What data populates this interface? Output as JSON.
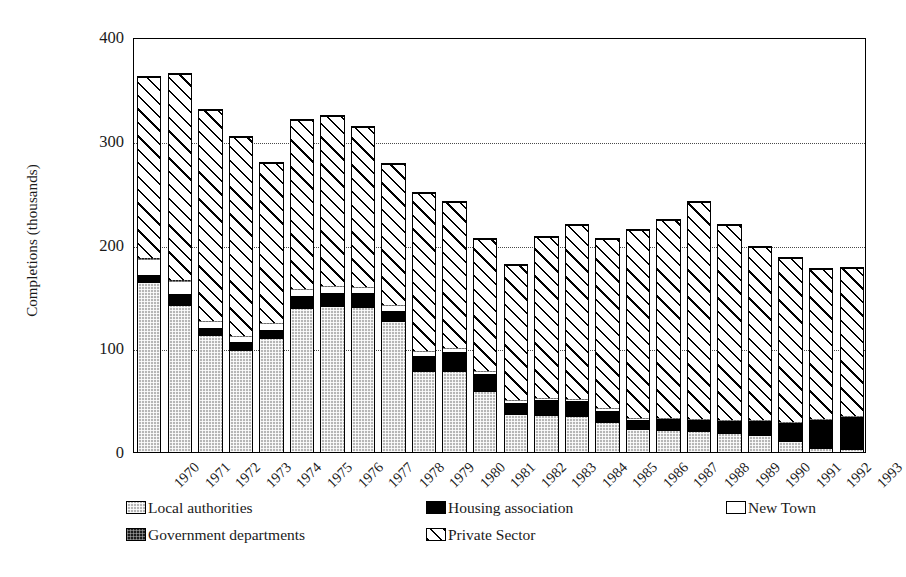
{
  "chart_data": {
    "type": "bar",
    "stacked": true,
    "title": "",
    "xlabel": "",
    "ylabel": "Completions (thousands)",
    "ylim": [
      0,
      400
    ],
    "yticks": [
      0,
      100,
      200,
      300,
      400
    ],
    "ytick_labels": [
      "0",
      "100",
      "200",
      "300",
      "400"
    ],
    "grid": "horizontal-dotted",
    "legend_position": "below-plot",
    "categories": [
      "1970",
      "1971",
      "1972",
      "1973",
      "1974",
      "1975",
      "1976",
      "1977",
      "1978",
      "1979",
      "1980",
      "1981",
      "1982",
      "1983",
      "1984",
      "1985",
      "1986",
      "1987",
      "1988",
      "1989",
      "1990",
      "1991",
      "1992",
      "1993"
    ],
    "series": [
      {
        "name": "Local authorities",
        "pattern": "light-grey-checker",
        "color": "#b6b6b6",
        "values": [
          163,
          141,
          112,
          97,
          109,
          138,
          140,
          139,
          125,
          77,
          77,
          58,
          36,
          35,
          34,
          28,
          21,
          20,
          19,
          17,
          15,
          10,
          3,
          2
        ]
      },
      {
        "name": "Housing association",
        "pattern": "solid-black",
        "color": "#000000",
        "values": [
          8,
          11,
          8,
          9,
          9,
          12,
          13,
          14,
          11,
          16,
          19,
          17,
          11,
          15,
          15,
          12,
          10,
          12,
          12,
          13,
          15,
          18,
          28,
          32
        ]
      },
      {
        "name": "New Town",
        "pattern": "white-open",
        "color": "#ffffff",
        "values": [
          14,
          12,
          5,
          5,
          5,
          6,
          6,
          5,
          5,
          3,
          3,
          2,
          2,
          1,
          1,
          1,
          1,
          0,
          0,
          0,
          0,
          0,
          0,
          0
        ]
      },
      {
        "name": "Government departments",
        "pattern": "dark-checker",
        "color": "#1c1c1c",
        "values": [
          2,
          2,
          1,
          1,
          1,
          1,
          1,
          1,
          1,
          1,
          1,
          1,
          1,
          1,
          1,
          1,
          1,
          1,
          1,
          1,
          1,
          1,
          1,
          1
        ]
      },
      {
        "name": "Private Sector",
        "pattern": "diagonal-hatch",
        "color": "#ffffff",
        "values": [
          174,
          198,
          204,
          192,
          155,
          163,
          164,
          154,
          136,
          153,
          141,
          127,
          130,
          155,
          168,
          163,
          181,
          191,
          209,
          188,
          167,
          158,
          144,
          142
        ]
      }
    ],
    "totals": [
      361,
      364,
      330,
      304,
      279,
      320,
      324,
      313,
      278,
      250,
      241,
      205,
      180,
      207,
      219,
      205,
      214,
      224,
      241,
      219,
      198,
      187,
      176,
      177
    ]
  },
  "legend": {
    "entries": [
      {
        "label": "Local authorities",
        "pattern": "light-grey-checker"
      },
      {
        "label": "Housing association",
        "pattern": "solid-black"
      },
      {
        "label": "New Town",
        "pattern": "white-open"
      },
      {
        "label": "Government departments",
        "pattern": "dark-checker"
      },
      {
        "label": "Private Sector",
        "pattern": "diagonal-hatch"
      }
    ]
  }
}
